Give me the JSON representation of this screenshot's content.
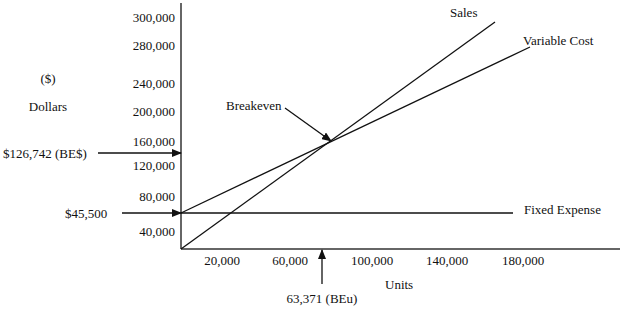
{
  "chart_data": {
    "type": "line",
    "xlabel": "Units",
    "ylabel": "Dollars",
    "ylabel_unit": "($)",
    "x_ticks": [
      "20,000",
      "60,000",
      "100,000",
      "140,000",
      "180,000"
    ],
    "y_ticks": [
      "40,000",
      "80,000",
      "120,000",
      "160,000",
      "200,000",
      "240,000",
      "280,000",
      "300,000"
    ],
    "series": [
      {
        "name": "Sales",
        "x": [
          0,
          63371,
          180000
        ],
        "y": [
          0,
          126742,
          360000
        ]
      },
      {
        "name": "Variable Cost",
        "x": [
          0,
          63371,
          180000
        ],
        "y": [
          45500,
          126742,
          275000
        ]
      },
      {
        "name": "Fixed Expense",
        "x": [
          0,
          180000
        ],
        "y": [
          45500,
          45500
        ]
      }
    ],
    "annotations": {
      "breakeven_label": "Breakeven",
      "breakeven_dollars": "$126,742 (BE$)",
      "breakeven_units": "63,371 (BEu)",
      "fixed_expense_value": "$45,500"
    },
    "legend_position": "inline labels at line ends",
    "grid": false
  },
  "labels": {
    "y_unit": "($)",
    "y_title": "Dollars",
    "x_title": "Units",
    "sales": "Sales",
    "variable_cost": "Variable Cost",
    "fixed_expense": "Fixed Expense",
    "breakeven": "Breakeven",
    "be_dollars": "$126,742 (BE$)",
    "be_units": "63,371 (BEu)",
    "fixed_value": "$45,500"
  },
  "ticks": {
    "y": [
      {
        "label": "300,000",
        "y": 17
      },
      {
        "label": "280,000",
        "y": 45
      },
      {
        "label": "240,000",
        "y": 83
      },
      {
        "label": "200,000",
        "y": 111
      },
      {
        "label": "160,000",
        "y": 141
      },
      {
        "label": "120,000",
        "y": 165
      },
      {
        "label": "80,000",
        "y": 196
      },
      {
        "label": "40,000",
        "y": 231
      }
    ],
    "x": [
      {
        "label": "20,000",
        "x": 222
      },
      {
        "label": "60,000",
        "x": 290
      },
      {
        "label": "100,000",
        "x": 372
      },
      {
        "label": "140,000",
        "x": 447
      },
      {
        "label": "180,000",
        "x": 523
      }
    ]
  }
}
